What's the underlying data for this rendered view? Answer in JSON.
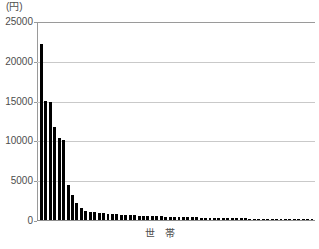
{
  "axes": {
    "y_unit_label": "(円)",
    "x_axis_title": "世　帯",
    "y_ticks": [
      "25000",
      "20000",
      "15000",
      "10000",
      "5000",
      "0"
    ]
  },
  "colors": {
    "bar": "#000000",
    "gridline": "#c9c9c9",
    "frame": "#9a9a9a",
    "text": "#4d4d4d",
    "background": "#ffffff"
  },
  "chart_data": {
    "type": "bar",
    "title": "",
    "subtitle": "",
    "xlabel": "世　帯",
    "ylabel": "(円)",
    "ylim": [
      0,
      25000
    ],
    "yticks": [
      0,
      5000,
      10000,
      15000,
      20000,
      25000
    ],
    "grid": true,
    "legend": null,
    "xtick_labels": [],
    "categories": [
      "1",
      "2",
      "3",
      "4",
      "5",
      "6",
      "7",
      "8",
      "9",
      "10",
      "11",
      "12",
      "13",
      "14",
      "15",
      "16",
      "17",
      "18",
      "19",
      "20",
      "21",
      "22",
      "23",
      "24",
      "25",
      "26",
      "27",
      "28",
      "29",
      "30",
      "31",
      "32",
      "33",
      "34",
      "35",
      "36",
      "37",
      "38",
      "39",
      "40",
      "41",
      "42",
      "43",
      "44",
      "45",
      "46",
      "47",
      "48",
      "49",
      "50",
      "51",
      "52",
      "53",
      "54",
      "55",
      "56",
      "57",
      "58",
      "59",
      "60",
      "61",
      "62"
    ],
    "values": [
      22200,
      15000,
      14900,
      11700,
      10400,
      10100,
      4400,
      3100,
      2150,
      1500,
      1200,
      1050,
      950,
      900,
      850,
      800,
      760,
      720,
      690,
      660,
      630,
      600,
      570,
      545,
      520,
      500,
      480,
      460,
      440,
      420,
      400,
      385,
      370,
      355,
      340,
      325,
      310,
      298,
      286,
      274,
      262,
      250,
      240,
      230,
      220,
      210,
      200,
      190,
      180,
      172,
      164,
      156,
      148,
      140,
      132,
      124,
      116,
      108,
      100,
      92,
      84,
      76
    ]
  }
}
